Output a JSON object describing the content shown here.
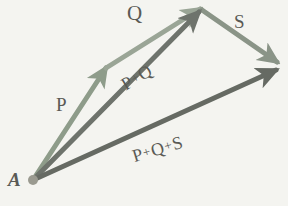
{
  "figure": {
    "kind": "vector-addition-diagram",
    "background_color": "#f4f4f0",
    "origin_label": "A",
    "origin_point": {
      "x": 33,
      "y": 180,
      "radius": 5,
      "color": "#9a9a90"
    }
  },
  "labels": {
    "origin": "A",
    "p": "P",
    "q": "Q",
    "s": "S",
    "pq_first": "P",
    "pq_plus": "+",
    "pq_second": "Q",
    "pqs_first": "P",
    "pqs_plus1": "+",
    "pqs_second": "Q",
    "pqs_plus2": "+",
    "pqs_third": "S"
  },
  "vectors": [
    {
      "name": "P",
      "label": "P",
      "color": "#8e9c8a",
      "width": 5,
      "from": {
        "x": 33,
        "y": 180
      },
      "to": {
        "x": 106,
        "y": 68
      }
    },
    {
      "name": "Q",
      "label": "Q",
      "color": "#9aa596",
      "width": 5,
      "from": {
        "x": 106,
        "y": 68
      },
      "to": {
        "x": 200,
        "y": 9
      }
    },
    {
      "name": "S",
      "label": "S",
      "color": "#8a9487",
      "width": 5,
      "from": {
        "x": 202,
        "y": 10
      },
      "to": {
        "x": 277,
        "y": 62
      }
    },
    {
      "name": "P+Q",
      "label": "P + Q",
      "color": "#6e736c",
      "width": 5,
      "from": {
        "x": 33,
        "y": 180
      },
      "to": {
        "x": 199,
        "y": 12
      }
    },
    {
      "name": "P+Q+S",
      "label": "P + Q + S",
      "color": "#666b64",
      "width": 5,
      "from": {
        "x": 33,
        "y": 180
      },
      "to": {
        "x": 276,
        "y": 70
      }
    }
  ]
}
